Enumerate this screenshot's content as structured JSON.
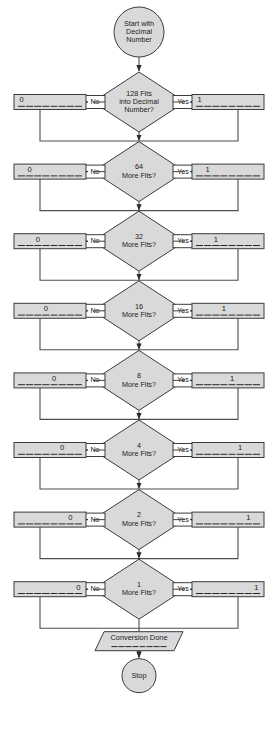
{
  "diagram": {
    "type": "flowchart",
    "colors": {
      "shape_fill": "#d9d9d9",
      "shape_stroke": "#3b3b3b",
      "label_fill": "#ffffff",
      "connector": "#4d4d4d",
      "text": "#1a1a1a",
      "background": "#ffffff"
    },
    "start": {
      "shape": "circle",
      "lines": [
        "Start with",
        "Decimal",
        "Number"
      ]
    },
    "branch_labels": {
      "no": "No",
      "yes": "Yes"
    },
    "result_values": {
      "no": "0",
      "yes": "1"
    },
    "bit_slots": 8,
    "rows": [
      {
        "weight": "128",
        "question_lines": [
          "128 Fits",
          "into Decimal",
          "Number?"
        ],
        "bit_index": 0,
        "no_value": "0",
        "yes_value": "1"
      },
      {
        "weight": "64",
        "question_lines": [
          "64",
          "More Fits?"
        ],
        "bit_index": 1,
        "no_value": "0",
        "yes_value": "1"
      },
      {
        "weight": "32",
        "question_lines": [
          "32",
          "More Fits?"
        ],
        "bit_index": 2,
        "no_value": "0",
        "yes_value": "1"
      },
      {
        "weight": "16",
        "question_lines": [
          "16",
          "More Fits?"
        ],
        "bit_index": 3,
        "no_value": "0",
        "yes_value": "1"
      },
      {
        "weight": "8",
        "question_lines": [
          "8",
          "More Fits?"
        ],
        "bit_index": 4,
        "no_value": "0",
        "yes_value": "1"
      },
      {
        "weight": "4",
        "question_lines": [
          "4",
          "More Fits?"
        ],
        "bit_index": 5,
        "no_value": "0",
        "yes_value": "1"
      },
      {
        "weight": "2",
        "question_lines": [
          "2",
          "More Fits?"
        ],
        "bit_index": 6,
        "no_value": "0",
        "yes_value": "1"
      },
      {
        "weight": "1",
        "question_lines": [
          "1",
          "More Fits?"
        ],
        "bit_index": 7,
        "no_value": "0",
        "yes_value": "1"
      }
    ],
    "output": {
      "shape": "parallelogram",
      "label": "Conversion Done"
    },
    "end": {
      "shape": "circle",
      "label": "Stop"
    }
  }
}
